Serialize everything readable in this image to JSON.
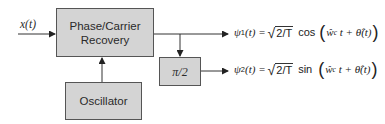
{
  "diagram": {
    "input": {
      "label": "x(t)"
    },
    "blocks": {
      "phase_carrier_recovery": {
        "line1": "Phase/Carrier",
        "line2": "Recovery"
      },
      "oscillator": {
        "label": "Oscillator"
      },
      "phase_shift": {
        "label": "π/2"
      }
    },
    "outputs": [
      {
        "symbol": "ψ",
        "subscript": "1",
        "arg": "(t) =",
        "sqrt_arg": "2/T",
        "func": "cos",
        "inner_w": "ŵ",
        "inner_w_sub": "c",
        "inner_rest": " t + ",
        "theta": "θ̂",
        "theta_arg": "(t)"
      },
      {
        "symbol": "ψ",
        "subscript": "2",
        "arg": "(t) =",
        "sqrt_arg": "2/T",
        "func": "sin",
        "inner_w": "ŵ",
        "inner_w_sub": "c",
        "inner_rest": " t + ",
        "theta": "θ̂",
        "theta_arg": "(t)"
      }
    ],
    "colors": {
      "block_fill": "#d4d4d4",
      "block_border": "#555555",
      "wire": "#333333"
    }
  }
}
